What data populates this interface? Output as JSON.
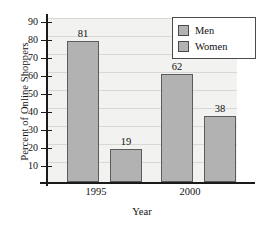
{
  "chart_data": {
    "type": "bar",
    "title": "",
    "subtitle": "",
    "xlabel": "Year",
    "ylabel": "Percent of Online Shoppers",
    "categories": [
      "1995",
      "2000"
    ],
    "series": [
      {
        "name": "Men",
        "values": [
          81,
          62
        ]
      },
      {
        "name": "Women",
        "values": [
          19,
          38
        ]
      }
    ],
    "ylim": [
      0,
      94
    ],
    "yticks": [
      90,
      80,
      70,
      60,
      50,
      40,
      30,
      20,
      10
    ],
    "ytick_labels": [
      "90",
      "80",
      "70",
      "60",
      "50",
      "40",
      "30",
      "20",
      "10"
    ],
    "grid": "horizontal",
    "legend_position": "top-right",
    "data_labels": [
      "81",
      "19",
      "62",
      "38"
    ],
    "colors": {
      "bar_fill": "#b2b2b2",
      "bar_border": "#5c5c5c",
      "plot_background": "#f2f2f0",
      "gridline": "#d8d8d4",
      "axis": "#1a1a1a",
      "text": "#111111",
      "legend_background": "#ffffff",
      "legend_border": "#4a4a4a"
    }
  },
  "axes": {
    "y_title": "Percent of Online Shoppers",
    "x_title": "Year",
    "y_ticks": [
      {
        "label": "90"
      },
      {
        "label": "80"
      },
      {
        "label": "70"
      },
      {
        "label": "60"
      },
      {
        "label": "50"
      },
      {
        "label": "40"
      },
      {
        "label": "30"
      },
      {
        "label": "20"
      },
      {
        "label": "10"
      }
    ],
    "x_ticks": [
      {
        "label": "1995"
      },
      {
        "label": "2000"
      }
    ]
  },
  "bars": [
    {
      "group": "1995",
      "series": "Men",
      "value": 81,
      "label": "81"
    },
    {
      "group": "1995",
      "series": "Women",
      "value": 19,
      "label": "19"
    },
    {
      "group": "2000",
      "series": "Men",
      "value": 62,
      "label": "62"
    },
    {
      "group": "2000",
      "series": "Women",
      "value": 38,
      "label": "38"
    }
  ],
  "legend": {
    "items": [
      {
        "label": "Men"
      },
      {
        "label": "Women"
      }
    ]
  }
}
